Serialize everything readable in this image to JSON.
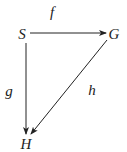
{
  "diagram": {
    "type": "commutative-diagram",
    "nodes": [
      {
        "id": "S",
        "label": "S",
        "x": 22,
        "y": 34
      },
      {
        "id": "G",
        "label": "G",
        "x": 114,
        "y": 34
      },
      {
        "id": "H",
        "label": "H",
        "x": 26,
        "y": 144
      }
    ],
    "edges": [
      {
        "from": "S",
        "to": "G",
        "label": "f",
        "label_x": 52,
        "label_y": 12
      },
      {
        "from": "S",
        "to": "H",
        "label": "g",
        "label_x": 9,
        "label_y": 91
      },
      {
        "from": "G",
        "to": "H",
        "label": "h",
        "label_x": 92,
        "label_y": 90
      }
    ],
    "colors": {
      "stroke": "#222222",
      "background": "#ffffff"
    }
  }
}
